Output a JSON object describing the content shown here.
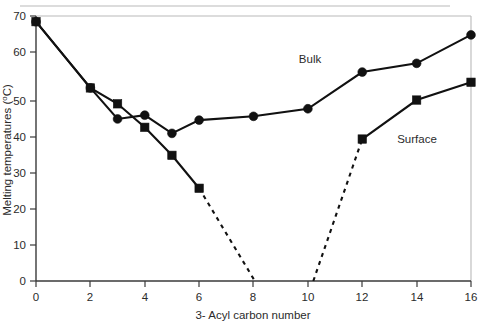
{
  "chart_data": {
    "type": "line",
    "title": "",
    "xlabel": "3- Acyl carbon number",
    "ylabel": "Melting temperatures (°C)",
    "xlim": [
      0,
      16
    ],
    "ylim": [
      0,
      70
    ],
    "xticks": [
      0,
      2,
      4,
      6,
      8,
      10,
      12,
      14,
      16
    ],
    "xtick_labels": [
      "0",
      "2",
      "4",
      "6",
      "8",
      "10",
      "12",
      "14",
      "16"
    ],
    "yticks": [
      0,
      10,
      20,
      30,
      40,
      50,
      60,
      70
    ],
    "ytick_labels": [
      "0",
      "10",
      "20",
      "30",
      "40",
      "50",
      "60",
      "70"
    ],
    "grid": false,
    "legend_position": "inline-annotation",
    "series": [
      {
        "name": "Bulk",
        "marker": "circle",
        "linestyle": "solid",
        "x": [
          0,
          2,
          3,
          4,
          5,
          6,
          8,
          10,
          12,
          14,
          16
        ],
        "values": [
          68.5,
          51,
          42.8,
          43.8,
          39,
          42.5,
          43.5,
          45.5,
          55.2,
          57.5,
          65
        ]
      },
      {
        "name": "Surface",
        "marker": "square",
        "linestyle": "solid",
        "x": [
          0,
          2,
          3,
          4,
          5,
          6
        ],
        "values": [
          68.5,
          51,
          46.8,
          40.6,
          33.2,
          24.5
        ]
      },
      {
        "name": "Surface",
        "marker": "square",
        "linestyle": "solid",
        "x": [
          12,
          14,
          16
        ],
        "values": [
          37.5,
          47.8,
          52.5
        ]
      }
    ],
    "extrapolations": [
      {
        "name": "surface-descending-dash",
        "linestyle": "dashed",
        "x": [
          6,
          8.05
        ],
        "values": [
          24.5,
          0
        ]
      },
      {
        "name": "surface-ascending-dash",
        "linestyle": "dashed",
        "x": [
          10.2,
          12
        ],
        "values": [
          0,
          37.5
        ]
      }
    ],
    "annotations": [
      {
        "name": "Bulk",
        "x": 10.1,
        "y": 58.5
      },
      {
        "name": "Surface",
        "x": 14.0,
        "y": 36.5
      }
    ]
  },
  "axis": {
    "y_title": "Melting temperatures (°C)",
    "y_title_main": "Melting temperatures (",
    "y_title_unit": "o",
    "y_title_tail": "C)",
    "x_title": "3- Acyl carbon number"
  },
  "labels": {
    "bulk": "Bulk",
    "surface": "Surface"
  }
}
